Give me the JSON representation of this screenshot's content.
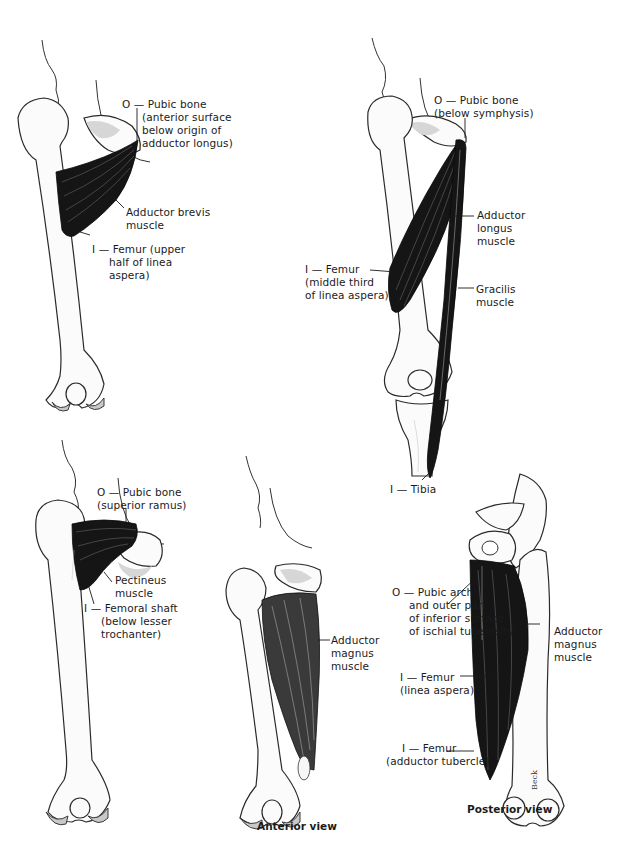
{
  "figure": {
    "type": "anatomical illustration",
    "panels": [
      {
        "id": "adductor-brevis",
        "labels": {
          "origin": [
            "O — Pubic bone",
            "(anterior surface",
            "below origin of",
            "adductor longus)"
          ],
          "muscle": [
            "Adductor brevis",
            "muscle"
          ],
          "insertion": [
            "I — Femur (upper",
            "half of linea",
            "aspera)"
          ]
        }
      },
      {
        "id": "adductor-longus-gracilis",
        "labels": {
          "origin": [
            "O — Pubic bone",
            "(below symphysis)"
          ],
          "muscle1": [
            "Adductor",
            "longus",
            "muscle"
          ],
          "insertion1": [
            "I — Femur",
            "(middle third",
            "of  linea aspera)"
          ],
          "muscle2": [
            "Gracilis",
            "muscle"
          ],
          "insertion2": [
            "I — Tibia"
          ]
        }
      },
      {
        "id": "pectineus",
        "labels": {
          "origin": [
            "O — Pubic bone",
            "(superior ramus)"
          ],
          "muscle": [
            "Pectineus",
            "muscle"
          ],
          "insertion": [
            "I — Femoral shaft",
            "(below lesser",
            "trochanter)"
          ]
        }
      },
      {
        "id": "adductor-magnus-anterior",
        "caption": "Anterior view",
        "labels": {
          "muscle": [
            "Adductor",
            "magnus",
            "muscle"
          ]
        }
      },
      {
        "id": "adductor-magnus-posterior",
        "caption": "Posterior view",
        "labels": {
          "origin": [
            "O — Pubic arch",
            "and outer part",
            "of inferior surface",
            "of ischial tuberosity"
          ],
          "muscle": [
            "Adductor",
            "magnus",
            "muscle"
          ],
          "insertion1": [
            "I — Femur",
            "(linea aspera)"
          ],
          "insertion2": [
            "I — Femur",
            "(adductor tubercle)"
          ]
        },
        "signature": "Beck"
      }
    ]
  }
}
